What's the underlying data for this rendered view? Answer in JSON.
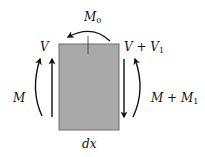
{
  "diagram": {
    "type": "beam-element-free-body",
    "element": {
      "label": "dx",
      "fill": "#a9a9a9",
      "stroke": "#6e6e6e"
    },
    "labels": {
      "top_moment": {
        "base": "M",
        "sub": "0"
      },
      "left_shear": "V",
      "right_shear": {
        "base": "V + V",
        "sub": "1"
      },
      "left_moment": "M",
      "right_moment": {
        "base": "M + M",
        "sub": "1"
      },
      "width": "dx"
    },
    "arrows": [
      {
        "name": "left-shear",
        "direction": "up",
        "style": "straight"
      },
      {
        "name": "left-moment",
        "direction": "up",
        "style": "curved"
      },
      {
        "name": "right-shear",
        "direction": "down",
        "style": "straight"
      },
      {
        "name": "right-moment",
        "direction": "up",
        "style": "curved"
      },
      {
        "name": "top-moment",
        "direction": "counterclockwise",
        "style": "curved"
      }
    ]
  }
}
